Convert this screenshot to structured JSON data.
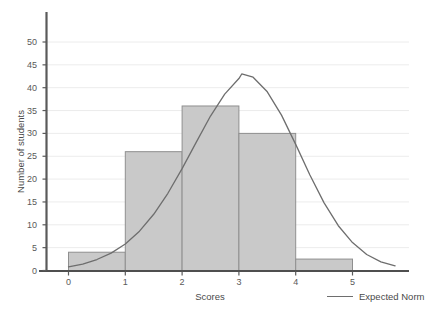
{
  "chart_data": {
    "type": "bar",
    "title": "",
    "subtitle": "",
    "xlabel": "Scores",
    "ylabel": "Number of students",
    "xlim": [
      -0.5,
      6.1
    ],
    "ylim": [
      0,
      53
    ],
    "grid": true,
    "x_ticks": [
      "0",
      "1",
      "2",
      "3",
      "4",
      "5"
    ],
    "y_ticks": [
      "0",
      "5",
      "10",
      "15",
      "20",
      "25",
      "30",
      "35",
      "40",
      "45",
      "50"
    ],
    "bin_edges": [
      0,
      1,
      2,
      3,
      4,
      5
    ],
    "categories": [
      "0-1",
      "1-2",
      "2-3",
      "3-4",
      "4-5"
    ],
    "values": [
      4,
      26,
      36,
      30,
      2.5
    ],
    "legend": {
      "position": "bottom-right",
      "entries": [
        {
          "label": "Expected Norm",
          "type": "line",
          "color": "#6e6e6e"
        }
      ]
    },
    "series": [
      {
        "name": "Number of students",
        "type": "bar",
        "values": [
          4,
          26,
          36,
          30,
          2.5
        ],
        "fill_color": "#c9c9c9",
        "edge_color": "#8f8f8f"
      },
      {
        "name": "Expected Norm",
        "type": "line",
        "color": "#6e6e6e",
        "distribution": "normal",
        "mean": 3.05,
        "sigma": 0.95,
        "peak_value": 43,
        "x": [
          0.0,
          0.25,
          0.5,
          0.75,
          1.0,
          1.25,
          1.5,
          1.75,
          2.0,
          2.25,
          2.5,
          2.75,
          3.0,
          3.05,
          3.25,
          3.5,
          3.75,
          4.0,
          4.25,
          4.5,
          4.75,
          5.0,
          5.25,
          5.5,
          5.75
        ],
        "y": [
          0.8,
          1.4,
          2.4,
          3.8,
          5.8,
          8.6,
          12.3,
          16.9,
          22.3,
          28.1,
          33.8,
          38.6,
          42.0,
          43.0,
          42.3,
          39.1,
          34.0,
          27.6,
          20.9,
          14.8,
          9.8,
          6.1,
          3.5,
          1.9,
          1.0
        ]
      }
    ]
  },
  "axis_titles": {
    "x": "Scores",
    "y": "Number of students"
  },
  "colors": {
    "bar_fill": "#c9c9c9",
    "bar_edge": "#8f8f8f",
    "curve": "#6e6e6e",
    "axis": "#555555",
    "grid": "#ececec",
    "text": "#4a4a4a",
    "background": "#ffffff"
  }
}
